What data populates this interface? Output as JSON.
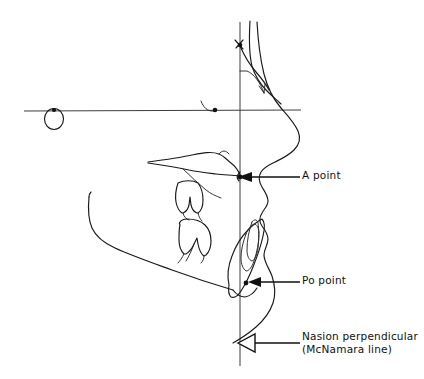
{
  "figure": {
    "background_color": "#ffffff",
    "line_color": "#1a1a1a",
    "reference_line_color": "#3d3d3d"
  },
  "callouts": [
    {
      "id": "a-point",
      "label": "A point",
      "label_line2": "",
      "arrow_style": "solid",
      "points_to": "A point landmark on maxilla at nasion perpendicular"
    },
    {
      "id": "po-point",
      "label": "Po point",
      "label_line2": "",
      "arrow_style": "solid",
      "points_to": "Pogonion landmark on chin at nasion perpendicular"
    },
    {
      "id": "nasion-perpendicular",
      "label": "Nasion perpendicular",
      "label_line2": "(McNamara line)",
      "arrow_style": "hollow",
      "points_to": "Vertical reference line dropped from nasion"
    }
  ],
  "landmarks": [
    {
      "id": "nasion",
      "label": ""
    },
    {
      "id": "orbitale",
      "label": ""
    },
    {
      "id": "porion",
      "label": ""
    },
    {
      "id": "a-point",
      "label": ""
    },
    {
      "id": "pogonion",
      "label": ""
    }
  ],
  "reference_lines": [
    {
      "id": "frankfort-horizontal",
      "label": "",
      "orientation": "horizontal"
    },
    {
      "id": "nasion-perpendicular",
      "label": "",
      "orientation": "vertical"
    }
  ],
  "anatomy": [
    {
      "id": "soft-tissue-profile",
      "label": ""
    },
    {
      "id": "frontal-bone-nose",
      "label": ""
    },
    {
      "id": "maxilla",
      "label": ""
    },
    {
      "id": "mandible",
      "label": ""
    },
    {
      "id": "upper-molar",
      "label": ""
    },
    {
      "id": "lower-molar",
      "label": ""
    },
    {
      "id": "lower-incisor",
      "label": ""
    },
    {
      "id": "symphysis",
      "label": ""
    },
    {
      "id": "external-auditory-meatus",
      "label": ""
    }
  ]
}
